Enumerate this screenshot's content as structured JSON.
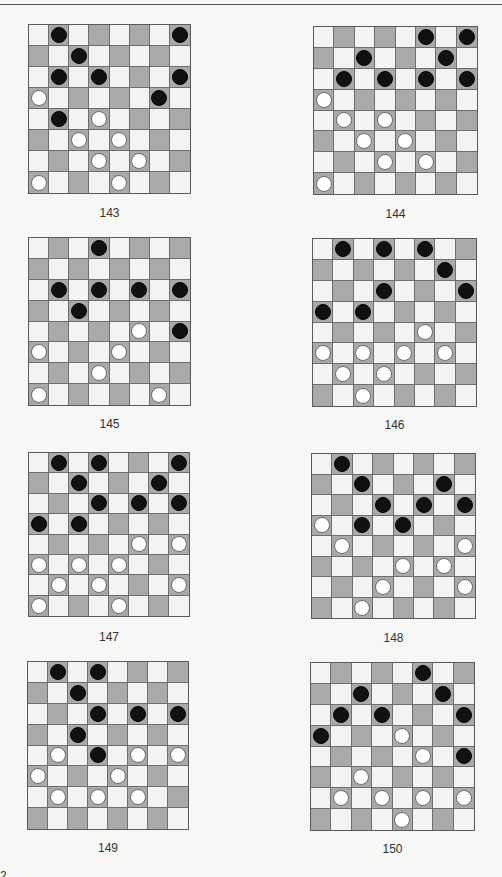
{
  "page": {
    "page_number_fragment": "2"
  },
  "diagrams": [
    {
      "label": "143",
      "black": [
        [
          0,
          1
        ],
        [
          0,
          7
        ],
        [
          1,
          2
        ],
        [
          2,
          1
        ],
        [
          2,
          3
        ],
        [
          2,
          7
        ],
        [
          3,
          6
        ],
        [
          4,
          1
        ]
      ],
      "white": [
        [
          3,
          0
        ],
        [
          4,
          3
        ],
        [
          5,
          2
        ],
        [
          5,
          4
        ],
        [
          6,
          3
        ],
        [
          6,
          5
        ],
        [
          7,
          0
        ],
        [
          7,
          4
        ]
      ]
    },
    {
      "label": "144",
      "black": [
        [
          0,
          5
        ],
        [
          0,
          7
        ],
        [
          1,
          2
        ],
        [
          1,
          6
        ],
        [
          2,
          1
        ],
        [
          2,
          3
        ],
        [
          2,
          5
        ],
        [
          2,
          7
        ]
      ],
      "white": [
        [
          3,
          0
        ],
        [
          4,
          1
        ],
        [
          4,
          3
        ],
        [
          5,
          2
        ],
        [
          5,
          4
        ],
        [
          6,
          3
        ],
        [
          6,
          5
        ],
        [
          7,
          0
        ]
      ]
    },
    {
      "label": "145",
      "black": [
        [
          0,
          3
        ],
        [
          2,
          1
        ],
        [
          2,
          3
        ],
        [
          2,
          5
        ],
        [
          2,
          7
        ],
        [
          3,
          2
        ],
        [
          4,
          7
        ]
      ],
      "white": [
        [
          4,
          5
        ],
        [
          5,
          0
        ],
        [
          5,
          4
        ],
        [
          6,
          3
        ],
        [
          7,
          0
        ],
        [
          7,
          6
        ]
      ]
    },
    {
      "label": "146",
      "black": [
        [
          0,
          1
        ],
        [
          0,
          3
        ],
        [
          0,
          5
        ],
        [
          1,
          6
        ],
        [
          2,
          3
        ],
        [
          2,
          7
        ],
        [
          3,
          0
        ],
        [
          3,
          2
        ]
      ],
      "white": [
        [
          4,
          5
        ],
        [
          5,
          0
        ],
        [
          5,
          2
        ],
        [
          5,
          4
        ],
        [
          5,
          6
        ],
        [
          6,
          1
        ],
        [
          6,
          3
        ],
        [
          7,
          2
        ]
      ]
    },
    {
      "label": "147",
      "black": [
        [
          0,
          1
        ],
        [
          0,
          3
        ],
        [
          0,
          7
        ],
        [
          1,
          2
        ],
        [
          1,
          6
        ],
        [
          2,
          3
        ],
        [
          2,
          5
        ],
        [
          2,
          7
        ],
        [
          3,
          0
        ],
        [
          3,
          2
        ]
      ],
      "white": [
        [
          4,
          5
        ],
        [
          4,
          7
        ],
        [
          5,
          0
        ],
        [
          5,
          2
        ],
        [
          5,
          4
        ],
        [
          6,
          1
        ],
        [
          6,
          3
        ],
        [
          6,
          7
        ],
        [
          7,
          0
        ],
        [
          7,
          4
        ]
      ]
    },
    {
      "label": "148",
      "black": [
        [
          0,
          1
        ],
        [
          1,
          2
        ],
        [
          1,
          6
        ],
        [
          2,
          3
        ],
        [
          2,
          5
        ],
        [
          2,
          7
        ],
        [
          3,
          2
        ],
        [
          3,
          4
        ]
      ],
      "white": [
        [
          3,
          0
        ],
        [
          4,
          1
        ],
        [
          4,
          7
        ],
        [
          5,
          4
        ],
        [
          5,
          6
        ],
        [
          6,
          3
        ],
        [
          6,
          7
        ],
        [
          7,
          2
        ]
      ]
    },
    {
      "label": "149",
      "black": [
        [
          0,
          1
        ],
        [
          0,
          3
        ],
        [
          1,
          2
        ],
        [
          2,
          3
        ],
        [
          2,
          5
        ],
        [
          2,
          7
        ],
        [
          3,
          2
        ],
        [
          4,
          3
        ]
      ],
      "white": [
        [
          4,
          1
        ],
        [
          4,
          5
        ],
        [
          4,
          7
        ],
        [
          5,
          0
        ],
        [
          5,
          4
        ],
        [
          6,
          1
        ],
        [
          6,
          3
        ],
        [
          6,
          5
        ]
      ]
    },
    {
      "label": "150",
      "black": [
        [
          0,
          5
        ],
        [
          1,
          2
        ],
        [
          1,
          6
        ],
        [
          2,
          1
        ],
        [
          2,
          3
        ],
        [
          2,
          7
        ],
        [
          3,
          0
        ],
        [
          4,
          7
        ]
      ],
      "white": [
        [
          3,
          4
        ],
        [
          4,
          5
        ],
        [
          5,
          2
        ],
        [
          6,
          1
        ],
        [
          6,
          3
        ],
        [
          6,
          5
        ],
        [
          6,
          7
        ],
        [
          7,
          4
        ]
      ]
    }
  ],
  "colors": {
    "light_square": "#f3f3f2",
    "dark_square": "#a9a9a9",
    "black_piece": "#111111",
    "white_piece": "#ffffff"
  }
}
